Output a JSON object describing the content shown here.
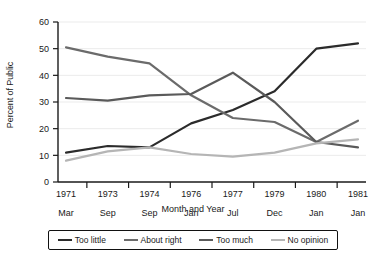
{
  "chart_data": {
    "type": "line",
    "title": "",
    "xlabel": "Month and Year",
    "ylabel": "Percent of Public",
    "ylim": [
      0,
      60
    ],
    "yticks": [
      0,
      10,
      20,
      30,
      40,
      50,
      60
    ],
    "grid": true,
    "legend_position": "bottom",
    "categories": [
      "1971 Mar",
      "1973 Sep",
      "1974 Sep",
      "1976 Jan",
      "1977 Jul",
      "1979 Dec",
      "1980 Jan",
      "1981 Jan"
    ],
    "category_years": [
      "1971",
      "1973",
      "1974",
      "1976",
      "1977",
      "1979",
      "1980",
      "1981"
    ],
    "category_months": [
      "Mar",
      "Sep",
      "Sep",
      "Jan",
      "Jul",
      "Dec",
      "Jan",
      "Jan"
    ],
    "series": [
      {
        "name": "Too little",
        "color": "#2b2b2b",
        "values": [
          11,
          13.5,
          13,
          22,
          27,
          34,
          50,
          52
        ]
      },
      {
        "name": "About right",
        "color": "#6b6b6b",
        "values": [
          50.5,
          47,
          44.5,
          32.5,
          24,
          22.5,
          15,
          23
        ]
      },
      {
        "name": "Too much",
        "color": "#5a5a5a",
        "values": [
          31.5,
          30.5,
          32.5,
          33,
          41,
          30,
          15,
          13
        ]
      },
      {
        "name": "No opinion",
        "color": "#b5b5b5",
        "values": [
          8,
          11.5,
          13,
          10.5,
          9.5,
          11,
          14.5,
          16
        ]
      }
    ]
  },
  "legend": {
    "items": [
      {
        "label": "Too little",
        "color": "#2b2b2b"
      },
      {
        "label": "About right",
        "color": "#6b6b6b"
      },
      {
        "label": "Too much",
        "color": "#5a5a5a"
      },
      {
        "label": "No opinion",
        "color": "#b5b5b5"
      }
    ]
  }
}
